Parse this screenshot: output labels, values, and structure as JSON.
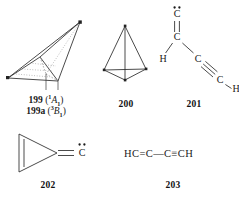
{
  "page": {
    "kind": "chemical-structure-plate",
    "background": "#ffffff",
    "ink": "#1a1a1a"
  },
  "structures": [
    {
      "id": "199",
      "type": "3d-wireframe-pyramid",
      "number_label": "199",
      "state_labels": [
        {
          "number": "199",
          "multiplicity": "1",
          "term": "A",
          "sub": "1",
          "full": "199 (1A1)"
        },
        {
          "number": "199a",
          "multiplicity": "3",
          "term": "B",
          "sub": "1",
          "full": "199a (3B1)"
        }
      ],
      "vertex_dots": 2
    },
    {
      "id": "200",
      "type": "tetrahedron",
      "number_label": "200"
    },
    {
      "id": "201",
      "type": "skeletal-carbene-enyne",
      "number_label": "201",
      "atoms": [
        {
          "symbol": "C",
          "role": "carbene-terminus",
          "lone_pair_dots": 2
        },
        {
          "symbol": "C",
          "role": "sp2"
        },
        {
          "symbol": "H",
          "role": "hydrogen"
        },
        {
          "symbol": "C",
          "role": "sp"
        },
        {
          "symbol": "C",
          "role": "sp"
        },
        {
          "symbol": "H",
          "role": "hydrogen"
        }
      ],
      "bonds": [
        {
          "from": 0,
          "to": 1,
          "order": 2
        },
        {
          "from": 1,
          "to": 2,
          "order": 1
        },
        {
          "from": 1,
          "to": 3,
          "order": 1
        },
        {
          "from": 3,
          "to": 4,
          "order": 3
        },
        {
          "from": 4,
          "to": 5,
          "order": 1
        }
      ]
    },
    {
      "id": "202",
      "type": "cyclopropenylidene-methylene",
      "number_label": "202",
      "ring_size": 3,
      "ring_double_bond": true,
      "exocyclic_bond_order": 2,
      "exocyclic_atom": {
        "symbol": "C",
        "lone_pair_dots": 2
      }
    },
    {
      "id": "203",
      "type": "linear-formula",
      "number_label": "203",
      "formula_tokens": [
        {
          "text": "HC",
          "kind": "atom"
        },
        {
          "text": "=",
          "kind": "bond-double"
        },
        {
          "text": "C",
          "kind": "atom"
        },
        {
          "text": "—",
          "kind": "bond-single"
        },
        {
          "text": "C",
          "kind": "atom"
        },
        {
          "text": "≡",
          "kind": "bond-triple"
        },
        {
          "text": "CH",
          "kind": "atom"
        }
      ],
      "formula_plain": "HC=C—C≡CH"
    }
  ]
}
